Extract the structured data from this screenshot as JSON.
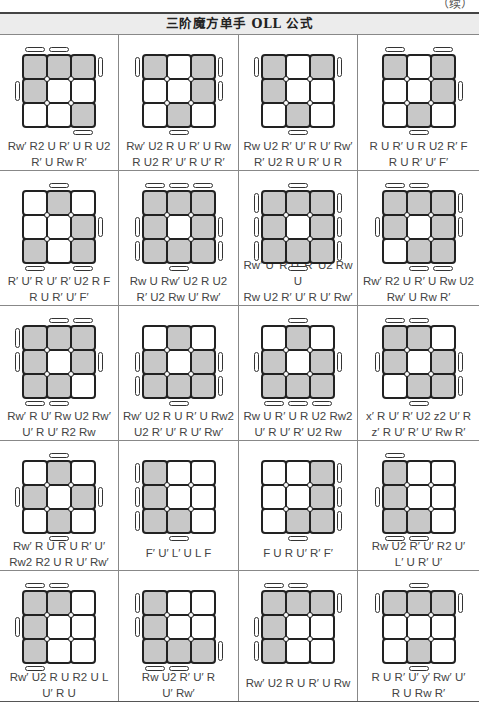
{
  "continued_label": "（续）",
  "table": {
    "title": "三阶魔方单手 OLL 公式",
    "colors": {
      "oriented": "#c8c8c8",
      "other": "#ffffff",
      "border": "#222222"
    },
    "cases": [
      {
        "id": 1,
        "grid": [
          "ggg",
          "gww",
          "wwg"
        ],
        "top": [
          0,
          1
        ],
        "bottom": [
          2
        ],
        "left": [
          1
        ],
        "right": [
          0
        ],
        "alg_line1": "Rw′ R2 U R′ U R U2",
        "alg_line2": "R′ U Rw R′"
      },
      {
        "id": 2,
        "grid": [
          "gwg",
          "wwg",
          "wgw"
        ],
        "top": [],
        "bottom": [
          1
        ],
        "left": [
          0
        ],
        "right": [
          0,
          1
        ],
        "alg_line1": "Rw′ U2 R U R′ U Rw",
        "alg_line2": "R U2 R′ U′ R U′ R′"
      },
      {
        "id": 3,
        "grid": [
          "gwg",
          "gww",
          "wgw"
        ],
        "top": [],
        "bottom": [
          1
        ],
        "left": [
          0
        ],
        "right": [
          0
        ],
        "alg_line1": "Rw U2 R′ U′ R U′ Rw′",
        "alg_line2": "R′ U2 R U R′ U R"
      },
      {
        "id": 4,
        "grid": [
          "gwg",
          "wwg",
          "wgw"
        ],
        "top": [
          0,
          2
        ],
        "bottom": [
          1
        ],
        "left": [],
        "right": [
          1
        ],
        "alg_line1": "R U R′ U R U2 R′ F",
        "alg_line2": "R U R′ U′ F′"
      },
      {
        "id": 5,
        "grid": [
          "wgw",
          "wwg",
          "gwg"
        ],
        "top": [
          1
        ],
        "bottom": [
          0,
          2
        ],
        "left": [],
        "right": [
          1
        ],
        "alg_line1": "R′ U′ R U′ R′ U2 R F",
        "alg_line2": "R U R′ U′ F′"
      },
      {
        "id": 6,
        "grid": [
          "ggg",
          "gwg",
          "ggg"
        ],
        "top": [
          0,
          1,
          2
        ],
        "bottom": [
          1
        ],
        "left": [
          1,
          2
        ],
        "right": [
          1,
          2
        ],
        "alg_line1": "Rw U Rw′ U2 R U2",
        "alg_line2": "R′ U2 Rw U′ Rw′"
      },
      {
        "id": 7,
        "grid": [
          "ggg",
          "gwg",
          "ggg"
        ],
        "top": [
          1
        ],
        "bottom": [
          1
        ],
        "left": [
          0,
          1,
          2
        ],
        "right": [
          0,
          1,
          2
        ],
        "alg_line1": "Rw′ U′ R U′ R′ U2 Rw U",
        "alg_line2": "Rw U2 R′ U′ R U′ Rw′"
      },
      {
        "id": 8,
        "grid": [
          "ggg",
          "gwg",
          "wgg"
        ],
        "top": [
          0,
          1
        ],
        "bottom": [
          1,
          2
        ],
        "left": [
          1
        ],
        "right": [
          0,
          1
        ],
        "alg_line1": "Rw′ R2 U R′ U Rw U2",
        "alg_line2": "Rw′ U Rw R′"
      },
      {
        "id": 9,
        "grid": [
          "ggg",
          "gwg",
          "ggw"
        ],
        "top": [
          1,
          2
        ],
        "bottom": [
          0,
          1
        ],
        "left": [
          0,
          1
        ],
        "right": [
          1
        ],
        "alg_line1": "Rw′ R U′ Rw U2 Rw′",
        "alg_line2": "U′ R U′ R2 Rw"
      },
      {
        "id": 10,
        "grid": [
          "wgw",
          "gwg",
          "ggg"
        ],
        "top": [],
        "bottom": [
          1
        ],
        "left": [
          1,
          2
        ],
        "right": [
          1,
          2
        ],
        "alg_line1": "Rw′ U2 R U R′ U Rw2",
        "alg_line2": "U2 R′ U′ R U′ Rw′"
      },
      {
        "id": 11,
        "grid": [
          "wgw",
          "gwg",
          "ggg"
        ],
        "top": [
          1
        ],
        "bottom": [
          0,
          1,
          2
        ],
        "left": [
          1
        ],
        "right": [
          1
        ],
        "alg_line1": "Rw U R′ U R U2 Rw2",
        "alg_line2": "U′ R U′ R′ U2 Rw"
      },
      {
        "id": 12,
        "grid": [
          "ggw",
          "gwg",
          "wgg"
        ],
        "top": [
          0,
          1
        ],
        "bottom": [
          1
        ],
        "left": [
          1
        ],
        "right": [
          1,
          2
        ],
        "alg_line1": "x′ R U′ R′ U2 z2 U′ R",
        "alg_line2": "z′ R U′ R′ U′ Rw R′"
      },
      {
        "id": 13,
        "grid": [
          "wgw",
          "gwg",
          "wgw"
        ],
        "top": [
          1
        ],
        "bottom": [
          1
        ],
        "left": [
          1
        ],
        "right": [
          1
        ],
        "alg_line1": "Rw′ R U R U R′ U′",
        "alg_line2": "Rw2 R2 U R U′ Rw′"
      },
      {
        "id": 14,
        "grid": [
          "gww",
          "gww",
          "ggw"
        ],
        "top": [],
        "bottom": [
          1
        ],
        "left": [
          0,
          1,
          2
        ],
        "right": [],
        "alg_line1": "F′ U′ L′ U L F",
        "alg_line2": ""
      },
      {
        "id": 15,
        "grid": [
          "wwg",
          "wwg",
          "wgg"
        ],
        "top": [],
        "bottom": [
          1
        ],
        "left": [],
        "right": [
          0,
          1,
          2
        ],
        "alg_line1": "F U R U′ R′ F′",
        "alg_line2": ""
      },
      {
        "id": 16,
        "grid": [
          "gww",
          "gww",
          "ggw"
        ],
        "top": [
          0
        ],
        "bottom": [
          0,
          1
        ],
        "left": [
          1
        ],
        "right": [],
        "alg_line1": "Rw U2 R′ U′ R2 U′",
        "alg_line2": "L′ U R′ U′"
      },
      {
        "id": 17,
        "grid": [
          "ggw",
          "gww",
          "gww"
        ],
        "top": [
          0,
          1
        ],
        "bottom": [
          0
        ],
        "left": [
          1
        ],
        "right": [],
        "alg_line1": "Rw′ U2 R U R2 U L",
        "alg_line2": "U′ R U"
      },
      {
        "id": 18,
        "grid": [
          "gww",
          "gww",
          "ggg"
        ],
        "top": [],
        "bottom": [
          0,
          1
        ],
        "left": [
          0,
          1
        ],
        "right": [
          2
        ],
        "alg_line1": "Rw U2 R′ U′ R",
        "alg_line2": "U′ Rw′"
      },
      {
        "id": 19,
        "grid": [
          "ggg",
          "gww",
          "gww"
        ],
        "top": [
          0,
          1
        ],
        "bottom": [],
        "left": [
          1,
          2
        ],
        "right": [
          0
        ],
        "alg_line1": "Rw′ U2 R U R′ U Rw",
        "alg_line2": ""
      },
      {
        "id": 20,
        "grid": [
          "ggg",
          "www",
          "wgw"
        ],
        "top": [
          1
        ],
        "bottom": [
          1
        ],
        "left": [
          0
        ],
        "right": [
          0
        ],
        "alg_line1": "R U R′ U′ y′ Rw′ U′",
        "alg_line2": "R U Rw R′"
      }
    ]
  }
}
